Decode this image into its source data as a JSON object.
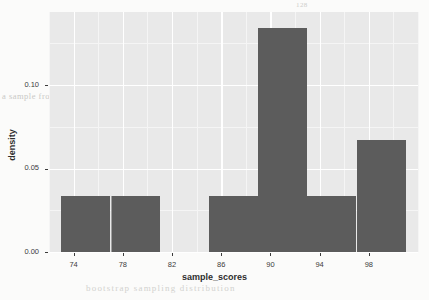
{
  "chart_data": {
    "type": "bar",
    "title": "",
    "subtitle": "",
    "xlabel": "sample_scores",
    "ylabel": "density",
    "xlim": [
      72.0,
      102.0
    ],
    "ylim": [
      0.0,
      0.1437
    ],
    "grid": true,
    "legend": "none",
    "binwidth": 4,
    "bar_color": "#5c5c5c",
    "panel_background": "#e9e9e9",
    "gridline_color": "#ffffff",
    "x_ticks": [
      74,
      78,
      82,
      86,
      90,
      94,
      98
    ],
    "x_tick_labels": [
      "74",
      "78",
      "82",
      "86",
      "90",
      "94",
      "98"
    ],
    "y_ticks": [
      0.0,
      0.05,
      0.1
    ],
    "y_tick_labels": [
      "0.00",
      "0.05",
      "0.10"
    ],
    "bins": [
      {
        "x_start": 73,
        "x_end": 77,
        "density": 0.0335
      },
      {
        "x_start": 77,
        "x_end": 81,
        "density": 0.0335
      },
      {
        "x_start": 81,
        "x_end": 85,
        "density": 0.0
      },
      {
        "x_start": 85,
        "x_end": 89,
        "density": 0.0335
      },
      {
        "x_start": 89,
        "x_end": 93,
        "density": 0.134
      },
      {
        "x_start": 93,
        "x_end": 97,
        "density": 0.0335
      },
      {
        "x_start": 97,
        "x_end": 101,
        "density": 0.067
      }
    ],
    "categories": [
      "73-77",
      "77-81",
      "81-85",
      "85-89",
      "89-93",
      "93-97",
      "97-101"
    ],
    "values": [
      0.0335,
      0.0335,
      0.0,
      0.0335,
      0.134,
      0.0335,
      0.067
    ]
  },
  "background_text": {
    "corner_number": "128",
    "line1": "the distribution of",
    "line2": "a sample from a population that is not",
    "line3": "normally distributed. The histogram of the",
    "line4": "sample is shown below and the shape is",
    "caption": "bootstrap sampling distribution",
    "edge1": "e",
    "edge2": "s"
  }
}
